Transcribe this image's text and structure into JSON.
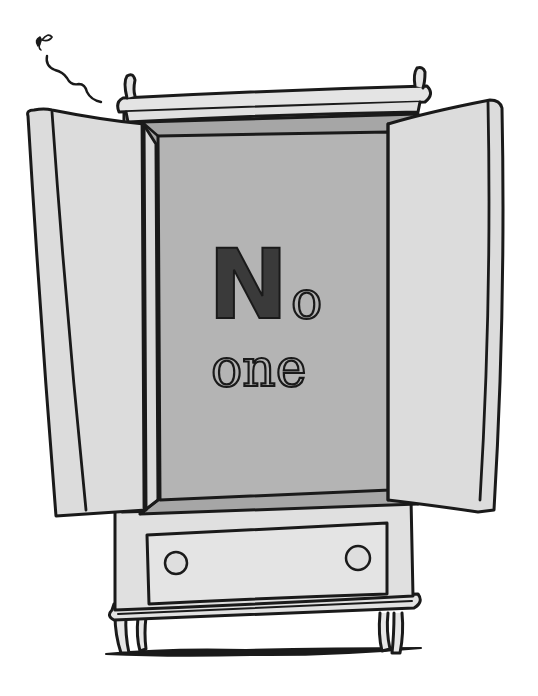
{
  "illustration": {
    "subject": "wardrobe-with-open-doors",
    "text": {
      "capital": "N",
      "first_line_rest": "o",
      "second_line": "one"
    },
    "colors": {
      "background": "#ffffff",
      "outline": "#1a1a1a",
      "cabinet_body": "#dedede",
      "cabinet_interior": "#b4b4b4",
      "cabinet_interior_edge": "#a6a6a6",
      "door_face": "#dcdcdc",
      "letter_fill": "#3a3a3a"
    },
    "decorations": [
      "fly",
      "squiggle-trail",
      "floor-shadow"
    ]
  }
}
